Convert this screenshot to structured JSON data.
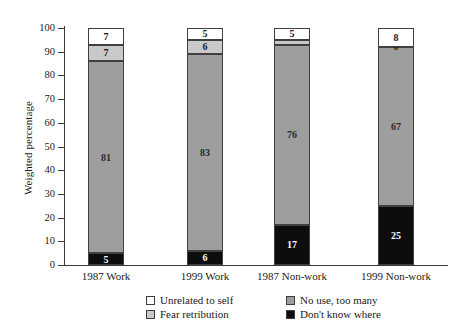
{
  "chart_data": {
    "type": "bar",
    "subtype": "stacked-bar-100",
    "title": "",
    "xlabel": "",
    "ylabel": "Weighted percentage",
    "ylim": [
      0,
      100
    ],
    "ytick_step": 10,
    "yticks": [
      "100",
      "90",
      "80",
      "70",
      "60",
      "50",
      "40",
      "30",
      "20",
      "10",
      "0"
    ],
    "grid": false,
    "legend_position": "bottom",
    "categories": [
      "1987 Work",
      "1999 Work",
      "1987 Non-work",
      "1999 Non-work"
    ],
    "series": [
      {
        "name": "Don't know where",
        "color": "#0d0d0d",
        "values": [
          5,
          6,
          17,
          25
        ]
      },
      {
        "name": "No use, too many",
        "color": "#9e9e9e",
        "values": [
          81,
          83,
          76,
          67
        ]
      },
      {
        "name": "Fear retribution",
        "color": "#c9c9c9",
        "values": [
          7,
          6,
          2,
          0
        ]
      },
      {
        "name": "Unrelated to self",
        "color": "#ffffff",
        "values": [
          7,
          5,
          5,
          8
        ]
      }
    ],
    "legend_entries": [
      {
        "label": "Unrelated to self",
        "color": "#ffffff"
      },
      {
        "label": "No use, too many",
        "color": "#9e9e9e"
      },
      {
        "label": "Fear retribution",
        "color": "#c9c9c9"
      },
      {
        "label": "Don't know where",
        "color": "#0d0d0d"
      }
    ],
    "bars": [
      {
        "category": "1987 Work",
        "segments": [
          {
            "series": "Don't know where",
            "value": 5,
            "label": "5"
          },
          {
            "series": "No use, too many",
            "value": 81,
            "label": "81"
          },
          {
            "series": "Fear retribution",
            "value": 7,
            "label": "7"
          },
          {
            "series": "Unrelated to self",
            "value": 7,
            "label": "7"
          }
        ]
      },
      {
        "category": "1999 Work",
        "segments": [
          {
            "series": "Don't know where",
            "value": 6,
            "label": "6"
          },
          {
            "series": "No use, too many",
            "value": 83,
            "label": "83"
          },
          {
            "series": "Fear retribution",
            "value": 6,
            "label": "6"
          },
          {
            "series": "Unrelated to self",
            "value": 5,
            "label": "5"
          }
        ]
      },
      {
        "category": "1987 Non-work",
        "segments": [
          {
            "series": "Don't know where",
            "value": 17,
            "label": "17"
          },
          {
            "series": "No use, too many",
            "value": 76,
            "label": "76"
          },
          {
            "series": "Fear retribution",
            "value": 2,
            "label": "2"
          },
          {
            "series": "Unrelated to self",
            "value": 5,
            "label": "5"
          }
        ]
      },
      {
        "category": "1999 Non-work",
        "segments": [
          {
            "series": "Don't know where",
            "value": 25,
            "label": "25"
          },
          {
            "series": "No use, too many",
            "value": 67,
            "label": "67"
          },
          {
            "series": "Fear retribution",
            "value": 0,
            "label": "0"
          },
          {
            "series": "Unrelated to self",
            "value": 8,
            "label": "8"
          }
        ]
      }
    ]
  }
}
